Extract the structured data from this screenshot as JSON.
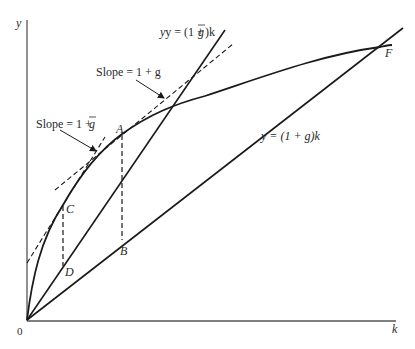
{
  "diagram": {
    "axes": {
      "y_label": "y",
      "x_label": "k",
      "origin_label": "0"
    },
    "curves": {
      "production_function_label": "F",
      "steep_line_label_prefix": "y = (1 + ",
      "steep_line_label_g": "g",
      "steep_line_label_suffix": ")k",
      "flat_line_label": "y = (1 + g)k"
    },
    "annotations": {
      "slope_g_label": "Slope = 1 + g",
      "slope_gbar_prefix": "Slope = 1 + ",
      "slope_gbar_g": "g"
    },
    "points": {
      "A": "A",
      "B": "B",
      "C": "C",
      "D": "D"
    },
    "colors": {
      "line": "#1a1a1a",
      "axis": "#555555",
      "text": "#2a2a2a"
    }
  }
}
